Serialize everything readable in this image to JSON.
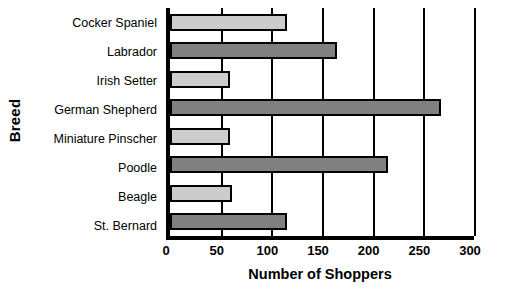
{
  "chart_data": {
    "type": "bar",
    "orientation": "horizontal",
    "title": "",
    "xlabel": "Number of Shoppers",
    "ylabel": "Breed",
    "categories": [
      "Cocker Spaniel",
      "Labrador",
      "Irish Setter",
      "German Shepherd",
      "Miniature Pinscher",
      "Poodle",
      "Beagle",
      "St. Bernard"
    ],
    "values": [
      115,
      165,
      59,
      267,
      59,
      215,
      61,
      115
    ],
    "xlim": [
      0,
      300
    ],
    "ylim": null,
    "xticks": [
      0,
      50,
      100,
      150,
      200,
      250,
      300
    ],
    "xtick_labels": [
      "0",
      "50",
      "100",
      "150",
      "200",
      "250",
      "300"
    ],
    "grid": "vertical",
    "legend": null,
    "bar_styles": [
      "light",
      "dark",
      "light",
      "dark",
      "light",
      "dark",
      "light",
      "dark"
    ],
    "colors": {
      "light_bar": "#cccccc",
      "dark_bar": "#808080",
      "bar_outline": "#000000",
      "axis": "#000000",
      "gridline": "#000000",
      "background": "#ffffff",
      "text": "#000000"
    }
  }
}
